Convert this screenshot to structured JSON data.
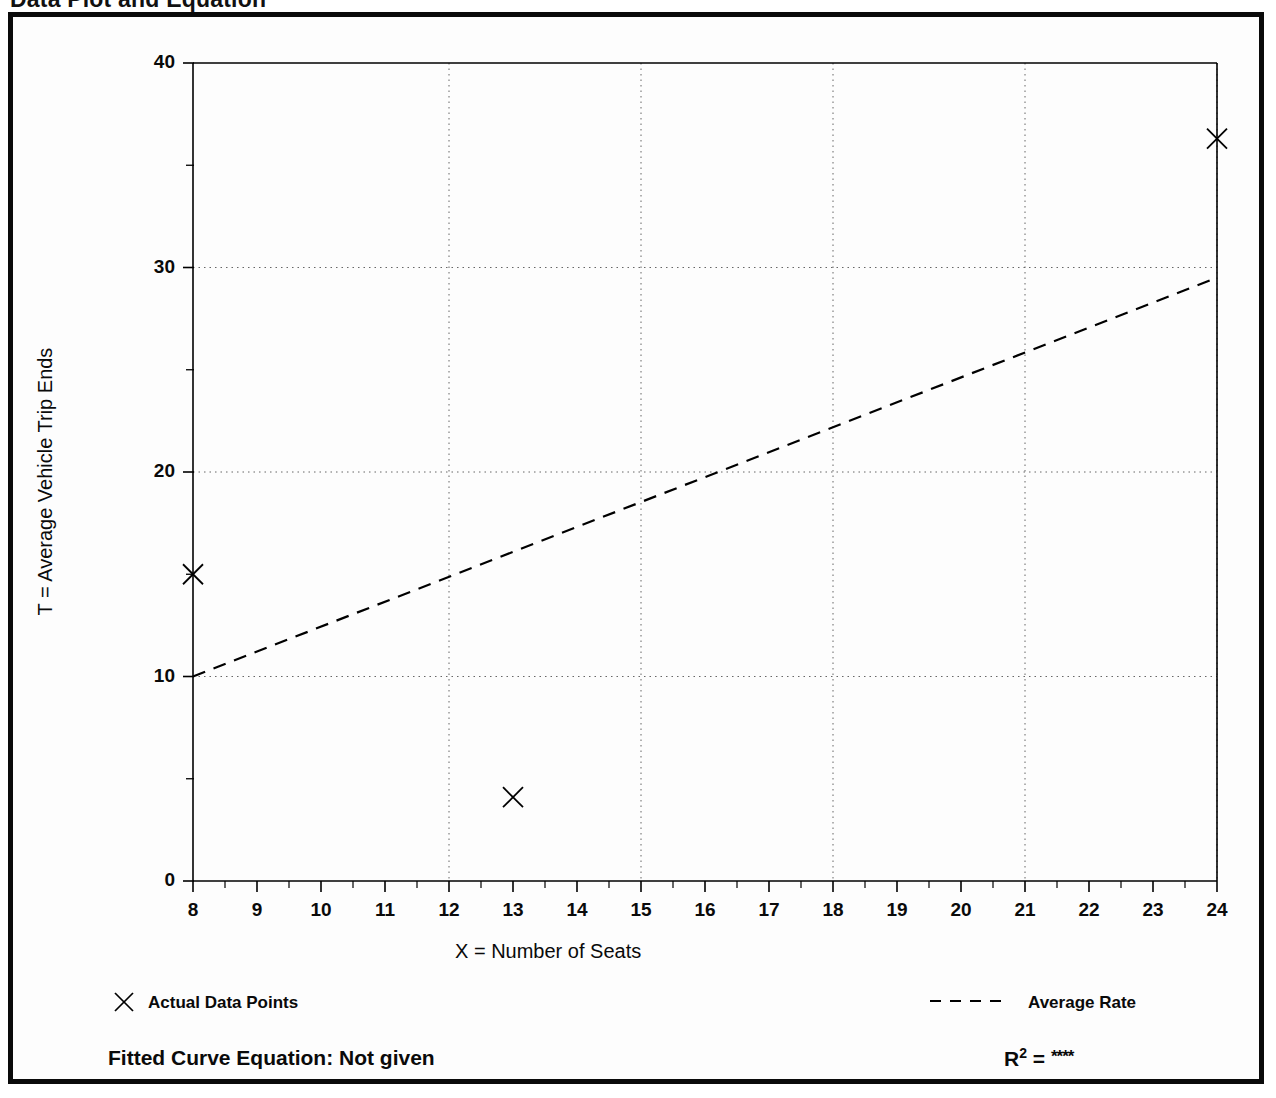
{
  "page": {
    "title": "Data Plot and Equation"
  },
  "chart_data": {
    "type": "scatter",
    "title": "Data Plot and Equation",
    "xlabel": "X = Number of Seats",
    "ylabel": "T = Average Vehicle Trip Ends",
    "xlim": [
      8,
      24
    ],
    "ylim": [
      0,
      40
    ],
    "xticks": [
      8,
      9,
      10,
      11,
      12,
      13,
      14,
      15,
      16,
      17,
      18,
      19,
      20,
      21,
      22,
      23,
      24
    ],
    "yticks": [
      0,
      10,
      20,
      30,
      40
    ],
    "y_minor_ticks": [
      5,
      15,
      25,
      35
    ],
    "grid": true,
    "grid_style": "dotted",
    "x_gridlines": [
      12,
      15,
      18,
      21,
      24
    ],
    "y_gridlines": [
      10,
      20,
      30
    ],
    "legend_position": "below-plot",
    "series": [
      {
        "name": "Actual Data Points",
        "type": "scatter",
        "marker": "x",
        "color": "#000000",
        "points": [
          {
            "x": 8,
            "y": 15.0
          },
          {
            "x": 13,
            "y": 4.1
          },
          {
            "x": 24,
            "y": 36.3
          }
        ]
      },
      {
        "name": "Average Rate",
        "type": "line",
        "linestyle": "dashed",
        "color": "#000000",
        "points": [
          {
            "x": 8,
            "y": 10.0
          },
          {
            "x": 24,
            "y": 29.5
          }
        ]
      }
    ]
  },
  "legend": {
    "marker_label": "Actual Data Points",
    "line_label": "Average Rate",
    "marker_glyph": "x-marker-icon",
    "line_glyph": "dashed-line-icon"
  },
  "footer": {
    "fitted_equation": "Fitted Curve Equation:  Not given",
    "r_squared_symbol": "R",
    "r_squared_exponent": "2",
    "r_squared_equals": " = ",
    "r_squared_value": "****"
  },
  "colors": {
    "frame": "#0a0a0a",
    "plot_line": "#000000",
    "grid": "#666666",
    "background": "#ffffff"
  }
}
